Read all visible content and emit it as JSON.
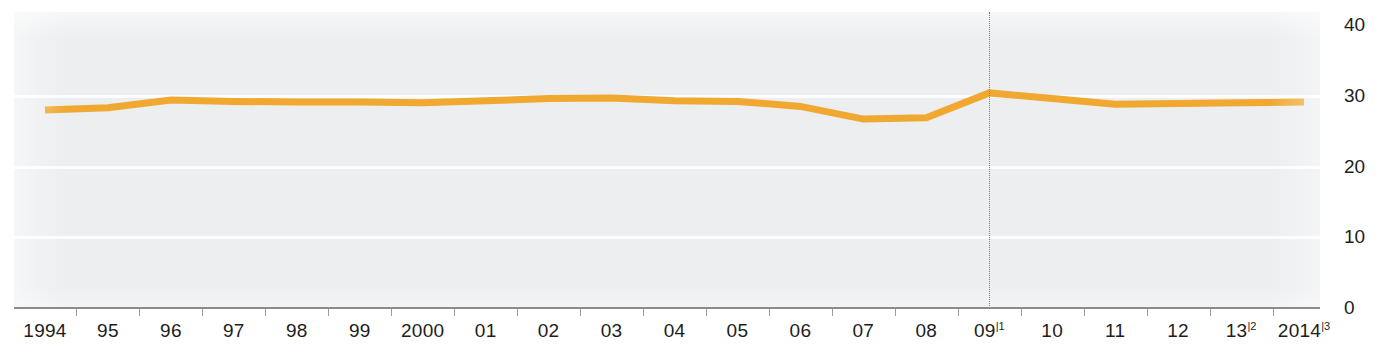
{
  "chart_data": {
    "type": "line",
    "title": "",
    "subtitle": "",
    "xlabel": "",
    "ylabel": "",
    "categories": [
      "1994",
      "95",
      "96",
      "97",
      "98",
      "99",
      "2000",
      "01",
      "02",
      "03",
      "04",
      "05",
      "06",
      "07",
      "08",
      "09",
      "10",
      "11",
      "12",
      "13",
      "2014"
    ],
    "x_tick_labels": [
      "1994",
      "95",
      "96",
      "97",
      "98",
      "99",
      "2000",
      "01",
      "02",
      "03",
      "04",
      "05",
      "06",
      "07",
      "08",
      "09",
      "10",
      "11",
      "12",
      "13",
      "2014"
    ],
    "x_tick_footnotes": [
      "",
      "",
      "",
      "",
      "",
      "",
      "",
      "",
      "",
      "",
      "",
      "",
      "",
      "",
      "",
      "1",
      "",
      "",
      "",
      "2",
      "3"
    ],
    "series": [
      {
        "name": "series-1",
        "color": "#f0a830",
        "values": [
          28.0,
          28.3,
          29.4,
          29.2,
          29.1,
          29.1,
          29.0,
          29.3,
          29.6,
          29.7,
          29.3,
          29.2,
          28.5,
          26.7,
          26.9,
          30.4,
          29.6,
          28.8,
          28.9,
          29.0,
          29.1
        ]
      }
    ],
    "y_ticks": [
      "40",
      "30",
      "20",
      "10",
      "0"
    ],
    "y_tick_values": [
      40,
      30,
      20,
      10,
      0
    ],
    "ylim": [
      0,
      40
    ],
    "xlim_labels": [
      "1994",
      "2014"
    ],
    "grid": true,
    "grid_color": "#fdfdfd",
    "legend": "none",
    "plot_background": "#eceef0",
    "axis_color": "#8a8d90",
    "annotations": [
      {
        "name": "break-in-series-marker",
        "type": "vertical-dotted-line",
        "at_category": "09",
        "style": "dotted",
        "color": "#7c7f82"
      }
    ]
  }
}
